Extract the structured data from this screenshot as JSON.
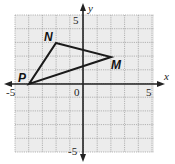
{
  "figure": {
    "type": "coordinate-plane",
    "x_axis_label": "x",
    "y_axis_label": "y",
    "tick_labels": {
      "x_min": "-5",
      "x_max": "5",
      "y_max": "5",
      "y_min": "-5",
      "origin": "0"
    },
    "grid": {
      "x_range": [
        -5,
        5
      ],
      "y_range": [
        -5,
        5
      ],
      "grid_on": true,
      "grid_color": "#9a9a9a",
      "fill_color": "#ececec"
    },
    "polygon": {
      "name": "triangle NMP",
      "stroke_color": "#1a1a1a",
      "vertices": [
        {
          "label": "N",
          "x": -2,
          "y": 3
        },
        {
          "label": "M",
          "x": 2,
          "y": 2
        },
        {
          "label": "P",
          "x": -4,
          "y": 0
        }
      ]
    }
  }
}
